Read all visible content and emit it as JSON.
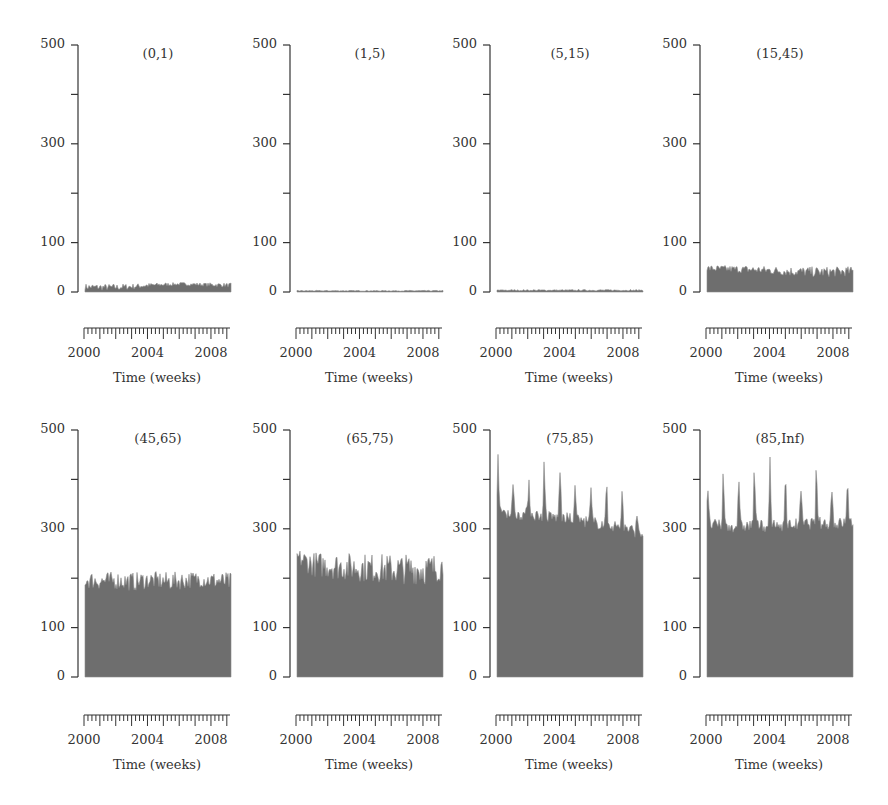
{
  "figure": {
    "panels_label": "Weekly counts by age group",
    "x_axis_title": "Time (weeks)"
  },
  "chart_data": [
    {
      "type": "area",
      "title": "(0,1)",
      "xlabel": "Time (weeks)",
      "ylabel": "",
      "ylim": [
        0,
        500
      ],
      "yticks": [
        0,
        100,
        300,
        500
      ],
      "yminor": [
        200,
        400
      ],
      "xticks": [
        "2000",
        "2004",
        "2008"
      ],
      "xrange": [
        2000,
        2009
      ],
      "series": [
        {
          "name": "(0,1)",
          "base_level": 8,
          "late_level": 14,
          "peak": 22,
          "x": [
            "2000",
            "2001",
            "2002",
            "2003",
            "2004",
            "2005",
            "2006",
            "2007",
            "2008",
            "2009"
          ],
          "values": [
            8,
            7,
            7,
            9,
            12,
            14,
            15,
            14,
            13,
            12
          ]
        }
      ],
      "grid": false,
      "legend": "none"
    },
    {
      "type": "area",
      "title": "(1,5)",
      "xlabel": "Time (weeks)",
      "ylabel": "",
      "ylim": [
        0,
        500
      ],
      "yticks": [
        0,
        100,
        300,
        500
      ],
      "yminor": [
        200,
        400
      ],
      "xticks": [
        "2000",
        "2004",
        "2008"
      ],
      "xrange": [
        2000,
        2009
      ],
      "series": [
        {
          "name": "(1,5)",
          "base_level": 2,
          "peak": 4,
          "x": [
            "2000",
            "2001",
            "2002",
            "2003",
            "2004",
            "2005",
            "2006",
            "2007",
            "2008",
            "2009"
          ],
          "values": [
            2,
            2,
            2,
            2,
            2,
            2,
            2,
            2,
            2,
            2
          ]
        }
      ],
      "grid": false,
      "legend": "none"
    },
    {
      "type": "area",
      "title": "(5,15)",
      "xlabel": "Time (weeks)",
      "ylabel": "",
      "ylim": [
        0,
        500
      ],
      "yticks": [
        0,
        100,
        300,
        500
      ],
      "yminor": [
        200,
        400
      ],
      "xticks": [
        "2000",
        "2004",
        "2008"
      ],
      "xrange": [
        2000,
        2009
      ],
      "series": [
        {
          "name": "(5,15)",
          "base_level": 3,
          "peak": 6,
          "x": [
            "2000",
            "2001",
            "2002",
            "2003",
            "2004",
            "2005",
            "2006",
            "2007",
            "2008",
            "2009"
          ],
          "values": [
            3,
            3,
            3,
            3,
            3,
            3,
            3,
            3,
            3,
            3
          ]
        }
      ],
      "grid": false,
      "legend": "none"
    },
    {
      "type": "area",
      "title": "(15,45)",
      "xlabel": "Time (weeks)",
      "ylabel": "",
      "ylim": [
        0,
        500
      ],
      "yticks": [
        0,
        100,
        300,
        500
      ],
      "yminor": [
        200,
        400
      ],
      "xticks": [
        "2000",
        "2004",
        "2008"
      ],
      "xrange": [
        2000,
        2009
      ],
      "series": [
        {
          "name": "(15,45)",
          "base_level": 38,
          "peak": 60,
          "x": [
            "2000",
            "2001",
            "2002",
            "2003",
            "2004",
            "2005",
            "2006",
            "2007",
            "2008",
            "2009"
          ],
          "values": [
            45,
            44,
            43,
            42,
            40,
            38,
            37,
            36,
            37,
            38
          ]
        }
      ],
      "grid": false,
      "legend": "none"
    },
    {
      "type": "area",
      "title": "(45,65)",
      "xlabel": "Time (weeks)",
      "ylabel": "",
      "ylim": [
        0,
        500
      ],
      "yticks": [
        0,
        100,
        300,
        500
      ],
      "yminor": [
        200,
        400
      ],
      "xticks": [
        "2000",
        "2004",
        "2008"
      ],
      "xrange": [
        2000,
        2009
      ],
      "series": [
        {
          "name": "(45,65)",
          "base_level": 185,
          "peak": 228,
          "x": [
            "2000",
            "2001",
            "2002",
            "2003",
            "2004",
            "2005",
            "2006",
            "2007",
            "2008",
            "2009"
          ],
          "values": [
            190,
            187,
            188,
            185,
            190,
            186,
            188,
            192,
            188,
            184
          ]
        }
      ],
      "grid": false,
      "legend": "none"
    },
    {
      "type": "area",
      "title": "(65,75)",
      "xlabel": "Time (weeks)",
      "ylabel": "",
      "ylim": [
        0,
        500
      ],
      "yticks": [
        0,
        100,
        300,
        500
      ],
      "yminor": [
        200,
        400
      ],
      "xticks": [
        "2000",
        "2004",
        "2008"
      ],
      "xrange": [
        2000,
        2009
      ],
      "series": [
        {
          "name": "(65,75)",
          "base_level": 205,
          "peak": 275,
          "x": [
            "2000",
            "2001",
            "2002",
            "2003",
            "2004",
            "2005",
            "2006",
            "2007",
            "2008",
            "2009"
          ],
          "values": [
            235,
            218,
            215,
            212,
            210,
            208,
            205,
            207,
            205,
            212
          ]
        }
      ],
      "grid": false,
      "legend": "none"
    },
    {
      "type": "area",
      "title": "(75,85)",
      "xlabel": "Time (weeks)",
      "ylabel": "",
      "ylim": [
        0,
        500
      ],
      "yticks": [
        0,
        100,
        300,
        500
      ],
      "yminor": [
        200,
        400
      ],
      "xticks": [
        "2000",
        "2004",
        "2008"
      ],
      "xrange": [
        2000,
        2009
      ],
      "series": [
        {
          "name": "(75,85)",
          "base_level": 320,
          "winter_peaks": [
            460,
            405,
            435,
            455,
            470,
            410,
            380,
            390,
            410,
            340
          ],
          "x": [
            "2000",
            "2001",
            "2002",
            "2003",
            "2004",
            "2005",
            "2006",
            "2007",
            "2008",
            "2009"
          ],
          "values": [
            340,
            330,
            330,
            325,
            322,
            318,
            312,
            308,
            300,
            290
          ]
        }
      ],
      "grid": false,
      "legend": "none"
    },
    {
      "type": "area",
      "title": "(85,Inf)",
      "xlabel": "Time (weeks)",
      "ylabel": "",
      "ylim": [
        0,
        500
      ],
      "yticks": [
        0,
        100,
        300,
        500
      ],
      "yminor": [
        200,
        400
      ],
      "xticks": [
        "2000",
        "2004",
        "2008"
      ],
      "xrange": [
        2000,
        2009
      ],
      "series": [
        {
          "name": "(85,Inf)",
          "base_level": 305,
          "winter_peaks": [
            400,
            420,
            410,
            445,
            455,
            430,
            390,
            430,
            415,
            440
          ],
          "x": [
            "2000",
            "2001",
            "2002",
            "2003",
            "2004",
            "2005",
            "2006",
            "2007",
            "2008",
            "2009"
          ],
          "values": [
            310,
            305,
            305,
            308,
            305,
            308,
            310,
            312,
            310,
            315
          ]
        }
      ],
      "grid": false,
      "legend": "none"
    }
  ],
  "layout": {
    "fill_color": "#6e6e6e",
    "axis_color": "#333333"
  }
}
